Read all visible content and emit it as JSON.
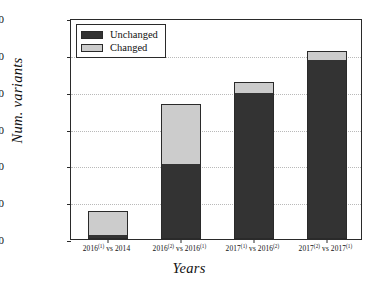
{
  "chart_data": {
    "type": "bar",
    "subtype": "stacked-bar",
    "title": "",
    "xlabel": "Years",
    "ylabel": "Num. variants",
    "categories": [
      "2016(1) vs 2014",
      "2016(2) vs 2016(1)",
      "2017(1) vs 2016(2)",
      "2017(2) vs 2017(1)"
    ],
    "category_labels_html": [
      "2016<sup>(1)</sup> vs 2014",
      "2016<sup>(2)</sup> vs 2016<sup>(1)</sup>",
      "2017<sup>(1)</sup> vs 2016<sup>(2)</sup>",
      "2017<sup>(2)</sup> vs 2017<sup>(1)</sup>"
    ],
    "series": [
      {
        "name": "Unchanged",
        "color": "#333333",
        "values": [
          150,
          4000,
          7900,
          9650
        ]
      },
      {
        "name": "Changed",
        "color": "#cccccc",
        "values": [
          1250,
          3200,
          500,
          450
        ]
      }
    ],
    "totals": [
      1400,
      7200,
      8400,
      10100
    ],
    "ylim": [
      0,
      12000
    ],
    "yticks": [
      0,
      2000,
      4000,
      6000,
      8000,
      10000,
      12000
    ],
    "ytick_labels": [
      "0",
      "2000",
      "4000",
      "6000",
      "8000",
      "10000",
      "12000"
    ],
    "grid": true,
    "grid_style": "dotted",
    "legend_position": "upper left",
    "legend_entries": [
      "Unchanged",
      "Changed"
    ]
  },
  "colors": {
    "unchanged": "#333333",
    "changed": "#cccccc",
    "axis": "#2a2a2a",
    "grid": "#b9b9b9",
    "background": "#ffffff"
  }
}
